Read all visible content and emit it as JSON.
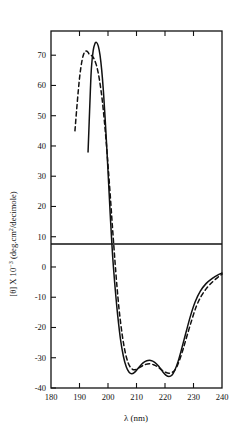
{
  "figure": {
    "name": "cd-spectrum-figure",
    "background": "#ffffff",
    "ink_color": "#111111"
  },
  "axis": {
    "x_label_main": "λ (nm)",
    "y_label_prefix": "[θ] X 10",
    "y_label_exp": "−3",
    "y_label_suffix": " (deg.cm",
    "y_label_suffix_exp": "2",
    "y_label_tail": "/decimole)",
    "y_label_full": "[θ] X 10⁻³ (deg.cm²/decimole)"
  },
  "chart_data": {
    "type": "line",
    "title": "",
    "xlabel": "λ (nm)",
    "ylabel": "[θ] X 10⁻³ (deg.cm²/decimole)",
    "xlim": [
      180,
      240
    ],
    "ylim": [
      -40,
      78
    ],
    "xticks": [
      180,
      190,
      200,
      210,
      220,
      230,
      240
    ],
    "xticklabels": [
      "180",
      "190",
      "200",
      "210",
      "220",
      "230",
      "240"
    ],
    "yticks": [
      70,
      60,
      50,
      40,
      30,
      20,
      10,
      0,
      -10,
      -20,
      -30,
      -40
    ],
    "yticklabels": [
      "70",
      "60",
      "50",
      "40",
      "30",
      "20",
      "10",
      "0",
      "-10",
      "-20",
      "-30",
      "-40"
    ],
    "grid": false,
    "legend": "none",
    "zero_line": 0,
    "series": [
      {
        "name": "solid-curve",
        "style": "solid",
        "color": "#111111",
        "points": [
          [
            193.0,
            38.0
          ],
          [
            193.4,
            48.0
          ],
          [
            193.8,
            58.0
          ],
          [
            194.2,
            66.0
          ],
          [
            194.8,
            71.5
          ],
          [
            195.4,
            73.8
          ],
          [
            196.0,
            74.2
          ],
          [
            196.6,
            73.0
          ],
          [
            197.2,
            70.0
          ],
          [
            197.8,
            65.0
          ],
          [
            198.4,
            58.0
          ],
          [
            199.0,
            49.0
          ],
          [
            199.6,
            39.0
          ],
          [
            200.2,
            28.0
          ],
          [
            200.8,
            17.0
          ],
          [
            201.4,
            7.0
          ],
          [
            201.9,
            0.0
          ],
          [
            202.6,
            -8.0
          ],
          [
            203.4,
            -16.0
          ],
          [
            204.4,
            -24.0
          ],
          [
            205.4,
            -29.5
          ],
          [
            206.4,
            -33.0
          ],
          [
            207.4,
            -34.8
          ],
          [
            208.4,
            -35.3
          ],
          [
            209.6,
            -34.6
          ],
          [
            210.8,
            -33.2
          ],
          [
            212.2,
            -31.8
          ],
          [
            213.6,
            -31.0
          ],
          [
            215.0,
            -30.9
          ],
          [
            216.4,
            -31.5
          ],
          [
            217.8,
            -32.8
          ],
          [
            219.2,
            -34.6
          ],
          [
            220.4,
            -35.8
          ],
          [
            221.4,
            -36.2
          ],
          [
            222.4,
            -35.8
          ],
          [
            223.4,
            -34.2
          ],
          [
            224.6,
            -31.2
          ],
          [
            226.0,
            -26.5
          ],
          [
            227.4,
            -21.5
          ],
          [
            229.0,
            -16.0
          ],
          [
            230.6,
            -11.5
          ],
          [
            232.4,
            -8.0
          ],
          [
            234.4,
            -5.5
          ],
          [
            236.6,
            -3.8
          ],
          [
            238.6,
            -2.6
          ],
          [
            240.0,
            -2.0
          ]
        ]
      },
      {
        "name": "dashed-curve",
        "style": "dashed",
        "color": "#111111",
        "points": [
          [
            188.4,
            45.0
          ],
          [
            189.0,
            52.0
          ],
          [
            189.6,
            58.5
          ],
          [
            190.2,
            64.0
          ],
          [
            190.9,
            68.3
          ],
          [
            191.6,
            70.7
          ],
          [
            192.3,
            71.4
          ],
          [
            193.0,
            71.0
          ],
          [
            193.4,
            70.3
          ],
          [
            194.0,
            70.0
          ],
          [
            194.6,
            69.6
          ],
          [
            195.2,
            68.6
          ],
          [
            195.9,
            66.8
          ],
          [
            196.6,
            64.0
          ],
          [
            197.3,
            60.0
          ],
          [
            198.0,
            55.0
          ],
          [
            198.7,
            48.5
          ],
          [
            199.4,
            41.0
          ],
          [
            200.1,
            32.5
          ],
          [
            200.8,
            23.5
          ],
          [
            201.5,
            14.0
          ],
          [
            202.2,
            5.0
          ],
          [
            202.6,
            0.0
          ],
          [
            203.2,
            -7.0
          ],
          [
            204.0,
            -15.0
          ],
          [
            205.0,
            -22.5
          ],
          [
            206.0,
            -28.0
          ],
          [
            207.0,
            -31.5
          ],
          [
            208.0,
            -33.3
          ],
          [
            209.2,
            -34.0
          ],
          [
            210.4,
            -33.6
          ],
          [
            211.8,
            -32.8
          ],
          [
            213.2,
            -32.2
          ],
          [
            214.6,
            -32.0
          ],
          [
            216.0,
            -32.3
          ],
          [
            217.4,
            -33.0
          ],
          [
            218.8,
            -34.0
          ],
          [
            220.2,
            -34.8
          ],
          [
            221.4,
            -35.1
          ],
          [
            222.6,
            -34.8
          ],
          [
            223.8,
            -33.6
          ],
          [
            225.0,
            -31.0
          ],
          [
            226.4,
            -27.0
          ],
          [
            227.8,
            -22.5
          ],
          [
            229.4,
            -17.5
          ],
          [
            231.0,
            -13.0
          ],
          [
            232.8,
            -9.5
          ],
          [
            234.8,
            -6.8
          ],
          [
            236.8,
            -4.8
          ],
          [
            238.8,
            -3.2
          ],
          [
            240.0,
            -2.4
          ]
        ]
      }
    ],
    "annotations": []
  }
}
